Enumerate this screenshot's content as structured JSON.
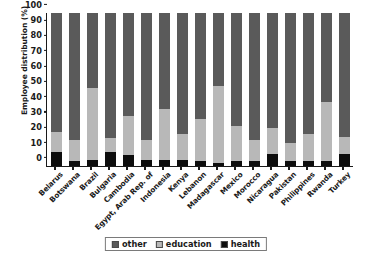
{
  "chart_data": {
    "type": "bar",
    "subtype": "stacked-100-percent",
    "title": "",
    "xlabel": "",
    "ylabel": "Employee distribution (%)",
    "ylim": [
      0,
      100
    ],
    "yticks": [
      0,
      10,
      20,
      30,
      40,
      50,
      60,
      70,
      80,
      90,
      100
    ],
    "grid": false,
    "legend_position": "bottom-center",
    "stack_order_bottom_to_top": [
      "health",
      "education",
      "other"
    ],
    "categories": [
      "Belarus",
      "Botswana",
      "Brazil",
      "Bulgaria",
      "Cambodia",
      "Egypt, Arab Rep. of",
      "Indonesia",
      "Kenya",
      "Lebanon",
      "Madagascar",
      "Mexico",
      "Morocco",
      "Nicaragua",
      "Pakistan",
      "Philippines",
      "Rwanda",
      "Turkey"
    ],
    "series": [
      {
        "name": "health",
        "color": "#0d0d0d",
        "values": [
          9,
          3,
          4,
          9,
          7,
          4,
          4,
          4,
          3,
          2,
          3,
          3,
          8,
          3,
          3,
          3,
          8
        ]
      },
      {
        "name": "education",
        "color": "#b8b8b8",
        "values": [
          13,
          14,
          47,
          9,
          26,
          13,
          33,
          17,
          28,
          50,
          23,
          14,
          17,
          12,
          18,
          39,
          11
        ]
      },
      {
        "name": "other",
        "color": "#5a5a5a",
        "values": [
          78,
          83,
          49,
          82,
          67,
          83,
          63,
          79,
          69,
          48,
          74,
          83,
          75,
          85,
          79,
          58,
          81
        ]
      }
    ]
  },
  "legend": {
    "items": [
      {
        "label": "other",
        "color": "#5a5a5a"
      },
      {
        "label": "education",
        "color": "#b8b8b8"
      },
      {
        "label": "health",
        "color": "#0d0d0d"
      }
    ]
  }
}
